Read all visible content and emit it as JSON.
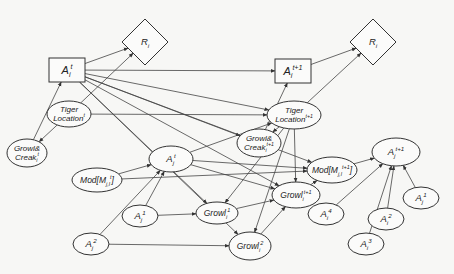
{
  "diagram": {
    "background": "#f7f7f5",
    "stroke_color": "#333333",
    "nodes": [
      {
        "id": "R_left",
        "shape": "diamond",
        "label": "R",
        "sub": "i",
        "sup": "",
        "cx": 145,
        "cy": 42
      },
      {
        "id": "Ai_t",
        "shape": "rect",
        "label": "A",
        "sub": "i",
        "sup": "t",
        "cx": 67,
        "cy": 70
      },
      {
        "id": "Tiger_t",
        "shape": "ellipse",
        "line1": "Tiger",
        "line2": "Location",
        "sup": "t",
        "cx": 69,
        "cy": 114,
        "rx": 22,
        "ry": 13
      },
      {
        "id": "GC_t",
        "shape": "ellipse",
        "line1": "Growl&",
        "line2": "Creak",
        "sub": "i",
        "sup": "t",
        "cx": 27,
        "cy": 153,
        "rx": 20,
        "ry": 14
      },
      {
        "id": "Mod_t",
        "shape": "ellipse",
        "label": "Mod[M",
        "sub": "j,l",
        "sup": "t",
        "tail": "]",
        "cx": 97,
        "cy": 180,
        "rx": 25,
        "ry": 12
      },
      {
        "id": "Aj_t",
        "shape": "ellipse",
        "label": "A",
        "sub": "j",
        "sup": "t",
        "cx": 171,
        "cy": 159,
        "rx": 22,
        "ry": 13
      },
      {
        "id": "Aj1_left",
        "shape": "ellipse",
        "label": "A",
        "sub": "j",
        "sup": "1",
        "cx": 140,
        "cy": 216,
        "rx": 18,
        "ry": 11
      },
      {
        "id": "Aj2_left",
        "shape": "ellipse",
        "label": "A",
        "sub": "j",
        "sup": "2",
        "cx": 91,
        "cy": 244,
        "rx": 18,
        "ry": 11
      },
      {
        "id": "R_right",
        "shape": "diamond",
        "label": "R",
        "sub": "i",
        "sup": "",
        "cx": 373,
        "cy": 42
      },
      {
        "id": "Ai_t1",
        "shape": "rect",
        "label": "A",
        "sub": "i",
        "sup": "t+1",
        "cx": 293,
        "cy": 71
      },
      {
        "id": "Tiger_t1",
        "shape": "ellipse",
        "line1": "Tiger",
        "line2": "Location",
        "sup": "t+1",
        "cx": 294,
        "cy": 115,
        "rx": 27,
        "ry": 14
      },
      {
        "id": "GC_t1",
        "shape": "ellipse",
        "line1": "Growl&",
        "line2": "Creak",
        "sub": "i",
        "sup": "t+1",
        "cx": 259,
        "cy": 143,
        "rx": 22,
        "ry": 14
      },
      {
        "id": "Mod_t1",
        "shape": "ellipse",
        "label": "Mod[M",
        "sub": "j,l",
        "sup": "t+1",
        "tail": "]",
        "cx": 332,
        "cy": 170,
        "rx": 25,
        "ry": 13
      },
      {
        "id": "Growl_t1",
        "shape": "ellipse",
        "label": "Growl",
        "sub": "i",
        "sup": "t+1",
        "cx": 296,
        "cy": 195,
        "rx": 24,
        "ry": 13
      },
      {
        "id": "Growl1",
        "shape": "ellipse",
        "label": "Growl",
        "sub": "i",
        "sup": "1",
        "cx": 217,
        "cy": 213,
        "rx": 21,
        "ry": 11
      },
      {
        "id": "Growl2",
        "shape": "ellipse",
        "label": "Growl",
        "sub": "i",
        "sup": "2",
        "cx": 250,
        "cy": 246,
        "rx": 21,
        "ry": 14
      },
      {
        "id": "Aj_t1",
        "shape": "ellipse",
        "label": "A",
        "sub": "j",
        "sup": "t+1",
        "cx": 396,
        "cy": 152,
        "rx": 24,
        "ry": 14
      },
      {
        "id": "Ai4",
        "shape": "ellipse",
        "label": "A",
        "sub": "i",
        "sup": "4",
        "cx": 326,
        "cy": 214,
        "rx": 18,
        "ry": 11
      },
      {
        "id": "Ai3",
        "shape": "ellipse",
        "label": "A",
        "sub": "i",
        "sup": "3",
        "cx": 366,
        "cy": 244,
        "rx": 18,
        "ry": 11
      },
      {
        "id": "Ai2",
        "shape": "ellipse",
        "label": "A",
        "sub": "i",
        "sup": "2",
        "cx": 386,
        "cy": 219,
        "rx": 18,
        "ry": 11
      },
      {
        "id": "Aj1_right",
        "shape": "ellipse",
        "label": "A",
        "sub": "j",
        "sup": "1",
        "cx": 421,
        "cy": 198,
        "rx": 18,
        "ry": 11
      }
    ],
    "edges": [
      {
        "from": "Ai_t",
        "to": "R_left"
      },
      {
        "from": "Tiger_t",
        "to": "R_left"
      },
      {
        "from": "Ai_t",
        "to": "Ai_t1"
      },
      {
        "from": "Ai_t",
        "to": "Tiger_t1"
      },
      {
        "from": "Ai_t",
        "to": "GC_t1"
      },
      {
        "from": "Ai_t",
        "to": "Mod_t1"
      },
      {
        "from": "Ai_t",
        "to": "Growl_t1"
      },
      {
        "from": "Ai_t",
        "to": "Growl1"
      },
      {
        "from": "Ai_t",
        "to": "Growl2"
      },
      {
        "from": "Tiger_t",
        "to": "Tiger_t1"
      },
      {
        "from": "Tiger_t",
        "to": "GC_t"
      },
      {
        "from": "GC_t",
        "to": "Ai_t"
      },
      {
        "from": "Mod_t",
        "to": "Aj_t"
      },
      {
        "from": "Mod_t",
        "to": "Mod_t1"
      },
      {
        "from": "Aj_t",
        "to": "Tiger_t1"
      },
      {
        "from": "Aj_t",
        "to": "Mod_t1"
      },
      {
        "from": "Aj_t",
        "to": "Growl_t1"
      },
      {
        "from": "Aj1_left",
        "to": "Growl1"
      },
      {
        "from": "Aj2_left",
        "to": "Growl2"
      },
      {
        "from": "Aj1_left",
        "to": "Aj_t"
      },
      {
        "from": "Aj2_left",
        "to": "Aj_t"
      },
      {
        "from": "GC_t1",
        "to": "Ai_t1"
      },
      {
        "from": "Tiger_t1",
        "to": "R_right"
      },
      {
        "from": "Tiger_t1",
        "to": "GC_t1"
      },
      {
        "from": "Tiger_t1",
        "to": "Growl_t1"
      },
      {
        "from": "Tiger_t1",
        "to": "Growl1"
      },
      {
        "from": "Tiger_t1",
        "to": "Growl2"
      },
      {
        "from": "Ai_t1",
        "to": "R_right"
      },
      {
        "from": "Growl_t1",
        "to": "Mod_t1"
      },
      {
        "from": "Growl1",
        "to": "Growl_t1"
      },
      {
        "from": "Growl2",
        "to": "Growl_t1"
      },
      {
        "from": "Mod_t1",
        "to": "Aj_t1"
      },
      {
        "from": "Ai4",
        "to": "Aj_t1"
      },
      {
        "from": "Ai3",
        "to": "Aj_t1"
      },
      {
        "from": "Ai2",
        "to": "Aj_t1"
      },
      {
        "from": "Aj1_right",
        "to": "Aj_t1"
      }
    ]
  }
}
